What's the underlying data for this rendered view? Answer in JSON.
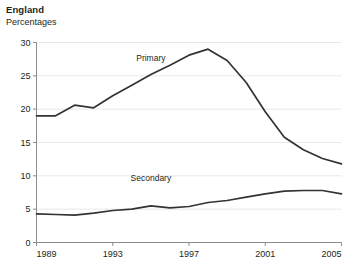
{
  "header": {
    "title": "England",
    "subtitle": "Percentages"
  },
  "chart_data": {
    "type": "line",
    "title": "England",
    "subtitle": "Percentages",
    "xlabel": "",
    "ylabel": "Percentages",
    "xlim": [
      1989,
      2005
    ],
    "ylim": [
      0,
      30
    ],
    "yticks": [
      0,
      5,
      10,
      15,
      20,
      25,
      30
    ],
    "xticks": [
      1989,
      1993,
      1997,
      2001,
      2005
    ],
    "grid": "horizontal",
    "legend": "inline-annotations",
    "x": [
      1989,
      1990,
      1991,
      1992,
      1993,
      1994,
      1995,
      1996,
      1997,
      1998,
      1999,
      2000,
      2001,
      2002,
      2003,
      2004,
      2005
    ],
    "series": [
      {
        "name": "Primary",
        "color": "#333333",
        "label_x": 1995,
        "label_y": 27.2,
        "values": [
          19.0,
          19.0,
          20.6,
          20.2,
          22.0,
          23.6,
          25.2,
          26.6,
          28.1,
          29.0,
          27.3,
          24.0,
          19.6,
          15.8,
          13.9,
          12.6,
          11.8
        ]
      },
      {
        "name": "Secondary",
        "color": "#333333",
        "label_x": 1995,
        "label_y": 9.2,
        "values": [
          4.3,
          4.2,
          4.1,
          4.4,
          4.8,
          5.0,
          5.5,
          5.2,
          5.4,
          6.0,
          6.3,
          6.8,
          7.3,
          7.7,
          7.8,
          7.8,
          7.3
        ]
      }
    ]
  },
  "axis": {
    "y_tick_labels": [
      "0",
      "5",
      "10",
      "15",
      "20",
      "25",
      "30"
    ],
    "x_tick_labels": [
      "1989",
      "1993",
      "1997",
      "2001",
      "2005"
    ]
  },
  "colors": {
    "line": "#333333",
    "grid": "#e8e8ea",
    "axis": "#8c8c8c",
    "text": "#231f20"
  }
}
